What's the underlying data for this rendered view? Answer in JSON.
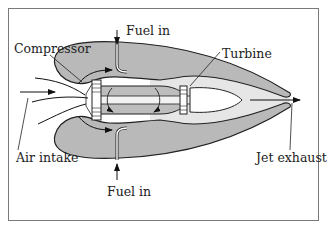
{
  "diagram": {
    "labels": {
      "compressor": "Compressor",
      "fuel_in_top": "Fuel in",
      "turbine": "Turbine",
      "air_intake": "Air intake",
      "jet_exhaust": "Jet exhaust",
      "fuel_in_bottom": "Fuel in"
    },
    "colors": {
      "casing": "#b9b9b9",
      "core": "#bdbdbd",
      "hot_gas": "#e4e4e4",
      "outline": "#222222",
      "border": "#7a7a7a"
    }
  }
}
